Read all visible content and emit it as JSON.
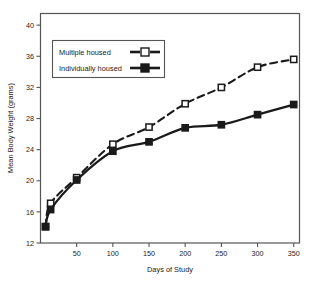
{
  "chart_data": {
    "type": "line",
    "title": "",
    "xlabel": "Days of Study",
    "ylabel": "Mean Body Weight (grams)",
    "xlim": [
      0,
      358
    ],
    "ylim": [
      12,
      41.5
    ],
    "xticks": [
      50,
      100,
      150,
      200,
      250,
      300,
      350
    ],
    "xticklabels": [
      "50",
      "100",
      "150",
      "200",
      "250",
      "300",
      "350"
    ],
    "yticks": [
      12,
      16,
      20,
      24,
      28,
      32,
      36,
      40
    ],
    "yticklabels": [
      "12",
      "16",
      "20",
      "24",
      "28",
      "32",
      "36",
      "40"
    ],
    "grid": false,
    "legend_position": "upper-left",
    "series": [
      {
        "name": "Multiple housed",
        "marker": "open-square",
        "linestyle": "dashed",
        "color": "#1a1a1a",
        "x": [
          7,
          14,
          50,
          100,
          150,
          200,
          250,
          300,
          350
        ],
        "y": [
          14.1,
          17.1,
          20.4,
          24.7,
          26.9,
          29.9,
          32.0,
          34.6,
          35.6
        ]
      },
      {
        "name": "Individually housed",
        "marker": "filled-square",
        "linestyle": "solid",
        "color": "#1a1a1a",
        "x": [
          7,
          14,
          50,
          100,
          150,
          200,
          250,
          300,
          350
        ],
        "y": [
          14.1,
          16.3,
          20.1,
          23.8,
          25.0,
          26.8,
          27.2,
          28.5,
          29.8
        ]
      }
    ]
  },
  "legend": {
    "entries": [
      {
        "label": "Multiple housed",
        "marker": "open-square",
        "linestyle": "dashed"
      },
      {
        "label": "Individually housed",
        "marker": "filled-square",
        "linestyle": "solid"
      }
    ]
  },
  "axes": {
    "x_title": "Days of Study",
    "y_title": "Mean Body Weight (grams)",
    "x_tick_labels": [
      "50",
      "100",
      "150",
      "200",
      "250",
      "300",
      "350"
    ],
    "y_tick_labels": [
      "12",
      "16",
      "20",
      "24",
      "28",
      "32",
      "36",
      "40"
    ]
  },
  "colors": {
    "ink": "#1a1a1a",
    "frame": "#4a4a4a",
    "background": "#ffffff"
  }
}
